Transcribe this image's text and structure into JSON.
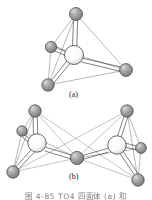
{
  "figure": {
    "panel_a_label": "(a)",
    "panel_b_label": "(b)",
    "caption": "图 4-85   TO4 四面体 (a) 和",
    "colors": {
      "background": "#ffffff",
      "oxygen_sphere_fill": "#9d9d9d",
      "oxygen_sphere_highlight": "#cfcfcf",
      "oxygen_sphere_shadow": "#6f6f6f",
      "center_sphere_fill": "#fbfbfb",
      "center_sphere_highlight": "#ffffff",
      "center_sphere_shadow": "#b8b8b8",
      "outline": "#3a3a3a",
      "bond_thin": "#6a6a6a",
      "bond_thick": "#2f2f2f",
      "label_text": "#1b1b1b"
    },
    "structures": [
      {
        "id": "panel-a",
        "name": "TO4 tetrahedron",
        "center_atom": {
          "label": "T",
          "cx": 74,
          "cy": 55,
          "r": 9.5,
          "type": "center"
        },
        "vertex_atoms": [
          {
            "label": "O1",
            "cx": 76,
            "cy": 14,
            "r": 6.5,
            "type": "oxygen"
          },
          {
            "label": "O2",
            "cx": 51,
            "cy": 47,
            "r": 5.6,
            "type": "oxygen"
          },
          {
            "label": "O3",
            "cx": 48,
            "cy": 85,
            "r": 6.2,
            "type": "oxygen"
          },
          {
            "label": "O4",
            "cx": 126,
            "cy": 70,
            "r": 6.4,
            "type": "oxygen"
          }
        ]
      },
      {
        "id": "panel-b-left",
        "name": "left TO4 tetrahedron",
        "center_atom": {
          "label": "T",
          "cx": 37,
          "cy": 143,
          "r": 9.2,
          "type": "center"
        },
        "vertex_atoms": [
          {
            "label": "O1",
            "cx": 35,
            "cy": 111,
            "r": 6.2,
            "type": "oxygen"
          },
          {
            "label": "O2",
            "cx": 22,
            "cy": 131,
            "r": 5.2,
            "type": "oxygen"
          },
          {
            "label": "O3",
            "cx": 13,
            "cy": 172,
            "r": 6.2,
            "type": "oxygen"
          }
        ]
      },
      {
        "id": "panel-b-right",
        "name": "right TO4 tetrahedron",
        "center_atom": {
          "label": "T",
          "cx": 117,
          "cy": 145,
          "r": 9.2,
          "type": "center"
        },
        "vertex_atoms": [
          {
            "label": "O1",
            "cx": 127,
            "cy": 111,
            "r": 6.2,
            "type": "oxygen"
          },
          {
            "label": "O2",
            "cx": 141,
            "cy": 148,
            "r": 5.4,
            "type": "oxygen"
          },
          {
            "label": "O3",
            "cx": 138,
            "cy": 180,
            "r": 6.2,
            "type": "oxygen"
          }
        ]
      },
      {
        "id": "panel-b-bridge",
        "name": "bridging oxygen",
        "center_atom": null,
        "vertex_atoms": [
          {
            "label": "O-bridge",
            "cx": 77,
            "cy": 158,
            "r": 6.6,
            "type": "oxygen"
          }
        ]
      }
    ]
  }
}
